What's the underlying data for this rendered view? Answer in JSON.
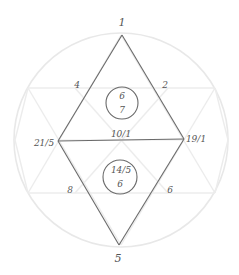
{
  "diagram": {
    "type": "numerology-hexagram-chart",
    "colors": {
      "background": "#ffffff",
      "guide_lines": "#ececec",
      "ink": "#6a6a6a",
      "text": "#555555"
    },
    "vertices": {
      "top": {
        "label": "1"
      },
      "left": {
        "label": "21/5"
      },
      "right": {
        "label": "19/1"
      },
      "bottom": {
        "label": "5"
      }
    },
    "edges": {
      "upper_left": {
        "label": "4"
      },
      "upper_right": {
        "label": "2"
      },
      "middle": {
        "label": "10/1"
      },
      "lower_left": {
        "label": "8"
      },
      "lower_right": {
        "label": "6"
      }
    },
    "circles": {
      "upper": {
        "top": "6",
        "bottom": "7"
      },
      "lower": {
        "top": "14/5",
        "bottom": "6"
      }
    }
  }
}
